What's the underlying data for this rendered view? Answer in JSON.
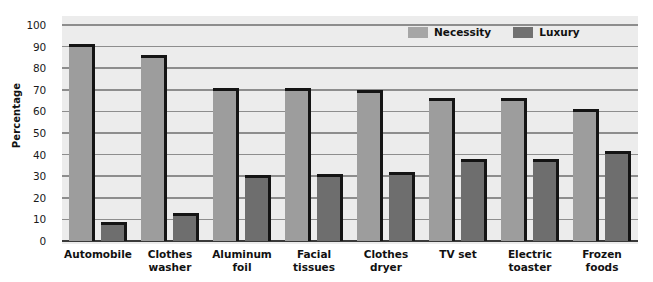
{
  "chart_data": {
    "type": "bar",
    "title": "",
    "xlabel": "",
    "ylabel": "Percentage",
    "ylim": [
      0,
      100
    ],
    "ytick_step": 10,
    "yticks": [
      0,
      10,
      20,
      30,
      40,
      50,
      60,
      70,
      80,
      90,
      100
    ],
    "grid": true,
    "legend_position": "top-right",
    "categories": [
      "Automobile",
      "Clothes\nwasher",
      "Aluminum\nfoil",
      "Facial\ntissues",
      "Clothes\ndryer",
      "TV set",
      "Electric\ntoaster",
      "Frozen\nfoods"
    ],
    "series": [
      {
        "name": "Necessity",
        "color": "#9d9d9d",
        "values": [
          91,
          86,
          71,
          71,
          70,
          66,
          66,
          61
        ]
      },
      {
        "name": "Luxury",
        "color": "#6e6e6e",
        "values": [
          9,
          13,
          30.5,
          31,
          32,
          38,
          38,
          41.5
        ]
      }
    ]
  },
  "legend": {
    "items": [
      {
        "label": "Necessity",
        "swatch": "necessity-swatch"
      },
      {
        "label": "Luxury",
        "swatch": "luxury-swatch"
      }
    ]
  },
  "colors": {
    "plot_background": "#ececec",
    "gridline": "#8d8d8d",
    "axis": "#2b2b2b",
    "bar_outline": "#141414",
    "necessity": "#9d9d9d",
    "luxury": "#6e6e6e"
  }
}
